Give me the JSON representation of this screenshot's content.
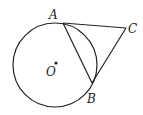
{
  "diagram": {
    "type": "geometry",
    "circle": {
      "center_label": "O",
      "cx": 55,
      "cy": 65,
      "r": 42
    },
    "points": {
      "A": {
        "label": "A",
        "x": 63,
        "y": 23
      },
      "B": {
        "label": "B",
        "x": 92,
        "y": 83
      },
      "C": {
        "label": "C",
        "x": 126,
        "y": 28
      },
      "O": {
        "label": "O",
        "x": 55,
        "y": 64
      }
    },
    "segments": [
      "AC",
      "BC",
      "AB"
    ],
    "colors": {
      "stroke": "#222222",
      "background": "#ffffff"
    }
  }
}
